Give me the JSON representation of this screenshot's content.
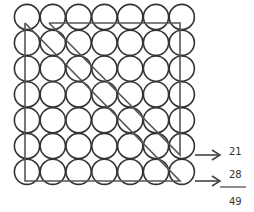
{
  "diagram": {
    "grid": {
      "rows": 7,
      "cols": 7,
      "total_circles": 49
    },
    "labels": {
      "upper_count": "21",
      "lower_count": "28",
      "sum": "49"
    },
    "colors": {
      "stroke": "#333333",
      "line": "#555555",
      "background": "#ffffff"
    }
  }
}
